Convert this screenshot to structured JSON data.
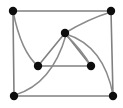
{
  "figure": {
    "kind": "undirected-graph-drawing",
    "width": 123,
    "height": 108,
    "background_color": "#ffffff",
    "node_color": "#0d0d0d",
    "edge_color": "#808080",
    "curved_edge_color": "#8a8a8a",
    "node_radius": 4.2,
    "edge_width": 1.6,
    "node_count": 7,
    "edge_count": 12
  },
  "nodes": [
    {
      "id": "top-left",
      "label": "",
      "x": 13,
      "y": 11
    },
    {
      "id": "top-right",
      "label": "",
      "x": 111,
      "y": 11
    },
    {
      "id": "center",
      "label": "",
      "x": 65,
      "y": 33
    },
    {
      "id": "left-middle",
      "label": "",
      "x": 38,
      "y": 66
    },
    {
      "id": "right-middle",
      "label": "",
      "x": 91,
      "y": 66
    },
    {
      "id": "bottom-left",
      "label": "",
      "x": 14,
      "y": 96
    },
    {
      "id": "bottom-right",
      "label": "",
      "x": 113,
      "y": 96
    }
  ],
  "edges": [
    {
      "id": "e-top",
      "from": "top-left",
      "to": "top-right",
      "style": "straight",
      "path": "M 13 11 L 111 11"
    },
    {
      "id": "e-left",
      "from": "top-left",
      "to": "bottom-left",
      "style": "straight",
      "path": "M 13 11 L 14 96"
    },
    {
      "id": "e-right",
      "from": "top-right",
      "to": "bottom-right",
      "style": "straight",
      "path": "M 111 11 L 113 96"
    },
    {
      "id": "e-bottom",
      "from": "bottom-left",
      "to": "bottom-right",
      "style": "straight",
      "path": "M 14 96 L 113 96"
    },
    {
      "id": "e-tl-lm-curve",
      "from": "top-left",
      "to": "left-middle",
      "style": "curved",
      "path": "M 13 11 Q 21 52 38 66"
    },
    {
      "id": "e-c-lm",
      "from": "center",
      "to": "left-middle",
      "style": "straight",
      "path": "M 65 33 L 38 66"
    },
    {
      "id": "e-lm-rm",
      "from": "left-middle",
      "to": "right-middle",
      "style": "straight",
      "path": "M 38 66 L 91 66"
    },
    {
      "id": "e-c-rm",
      "from": "center",
      "to": "right-middle",
      "style": "straight",
      "path": "M 65 33 L 91 66"
    },
    {
      "id": "e-c-tr-curve",
      "from": "center",
      "to": "top-right",
      "style": "curved",
      "path": "M 65 33 Q 88 19 111 12"
    },
    {
      "id": "e-c-br-curve",
      "from": "center",
      "to": "bottom-right",
      "style": "curved",
      "path": "M 66 34 Q 104 46 113 95"
    },
    {
      "id": "e-bl-c-curve",
      "from": "bottom-left",
      "to": "center",
      "style": "curved",
      "path": "M 15 95 Q 52 84 66 35"
    },
    {
      "id": "e-rm-curve",
      "from": "right-middle",
      "to": "center",
      "style": "curved",
      "path": "M 91 66 Q 82 50 66 35"
    }
  ]
}
